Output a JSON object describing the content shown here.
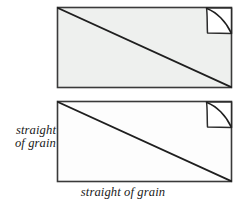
{
  "figure": {
    "colors": {
      "stroke": "#3a3a3a",
      "diagonal_stroke": "#1f1f1f",
      "top_panel_fill": "#eef0ee",
      "bottom_panel_fill": "#fdfdfd",
      "flap_fill": "#ffffff",
      "background": "#ffffff",
      "text": "#1a1a1a"
    },
    "panels": [
      {
        "name": "top-fabric-panel",
        "fill_label": "light gray",
        "x": 57,
        "y": 7,
        "width": 175,
        "height": 81,
        "diagonal": {
          "name": "bias-diagonal",
          "from": "top-left",
          "to": "bottom-right"
        },
        "folded_corner": {
          "name": "folded-corner-flap",
          "position": "top-right",
          "size": 26
        }
      },
      {
        "name": "bottom-fabric-panel",
        "fill_label": "white",
        "x": 57,
        "y": 101,
        "width": 175,
        "height": 81,
        "diagonal": {
          "name": "bias-diagonal",
          "from": "top-left",
          "to": "bottom-right"
        },
        "folded_corner": {
          "name": "folded-corner-flap",
          "position": "top-right",
          "size": 26
        }
      }
    ]
  },
  "labels": {
    "side": {
      "name": "straight-of-grain-vertical-label",
      "line1": "straight",
      "line2": "of grain"
    },
    "bottom": {
      "name": "straight-of-grain-horizontal-label",
      "text": "straight of grain"
    }
  }
}
